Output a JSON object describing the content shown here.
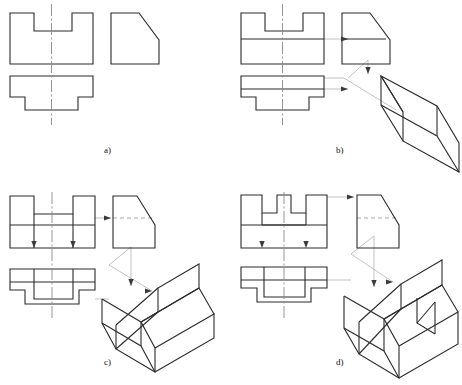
{
  "figure": {
    "type": "engineering-drawing-multiview",
    "panel_count": 4,
    "line_colors": {
      "object": "#2b2b2b",
      "centerline": "#7a7a7a",
      "projection": "#9a9a9a",
      "arrow": "#3a3a3a",
      "background": "#ffffff"
    }
  },
  "captions": {
    "a": "a)",
    "b": "b)",
    "c": "c)",
    "d": "d)"
  },
  "panels": [
    {
      "id": "a",
      "caption": "a)",
      "has_isometric": false,
      "views": [
        {
          "name": "front-view",
          "description": "Rectangle with rectangular notch cut from top center"
        },
        {
          "name": "side-view",
          "description": "Rectangle with top-right corner chamfered diagonally"
        },
        {
          "name": "top-view",
          "description": "T-shaped outline, wide top band with narrower stem and side steps"
        }
      ]
    },
    {
      "id": "b",
      "caption": "b)",
      "has_isometric": true,
      "isometric_description": "Prism block with a full-width sloped roof face, no notch visible",
      "views": [
        {
          "name": "front-view",
          "description": "Notched rectangle with horizontal division line at notch depth"
        },
        {
          "name": "side-view",
          "description": "Rectangle with chamfer and horizontal division line"
        },
        {
          "name": "top-view",
          "description": "T-shaped outline with horizontal division line"
        }
      ]
    },
    {
      "id": "c",
      "caption": "c)",
      "has_isometric": true,
      "isometric_description": "Block with sloped front face and a V-shaped channel slot cut down the middle",
      "views": [
        {
          "name": "front-view",
          "description": "Notched rectangle with horizontal line and two vertical interior lines"
        },
        {
          "name": "side-view",
          "description": "Chamfered rectangle with dashed hidden line"
        },
        {
          "name": "top-view",
          "description": "T-shape with interior rectangle slot outline"
        }
      ]
    },
    {
      "id": "d",
      "caption": "d)",
      "has_isometric": true,
      "isometric_description": "Block with sloped face and a deep rectangular through-slot splitting the raised portion",
      "views": [
        {
          "name": "front-view",
          "description": "Rectangle with deep central notch reaching the base band"
        },
        {
          "name": "side-view",
          "description": "Chamfered rectangle with dashed hidden line"
        },
        {
          "name": "top-view",
          "description": "T-shape with deep interior slot outline"
        }
      ]
    }
  ]
}
